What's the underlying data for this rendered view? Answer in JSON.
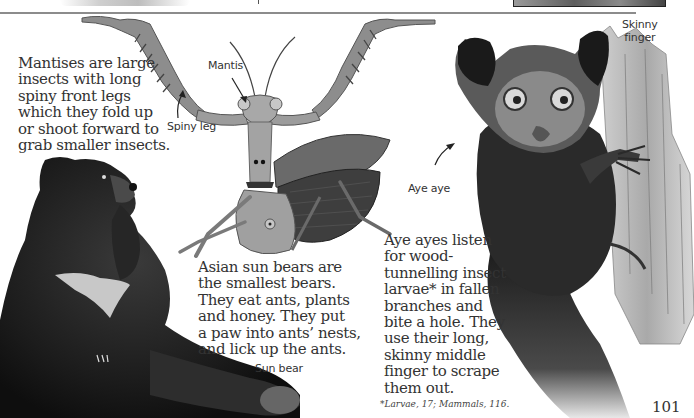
{
  "page": {
    "number": "101",
    "footnote": "*Larvae, 17; Mammals, 116."
  },
  "mantis": {
    "paragraph": [
      "Mantises are large",
      "insects with long",
      "spiny front legs",
      "which they fold up",
      "or shoot forward to",
      "grab smaller insects."
    ],
    "labels": {
      "name": "Mantis",
      "leg": "Spiny leg"
    }
  },
  "sun_bear": {
    "paragraph": [
      "Asian sun bears are",
      "the smallest bears.",
      "They eat ants, plants",
      "and honey. They put",
      "a paw into ants’ nests,",
      "and lick up the ants."
    ],
    "labels": {
      "name": "Sun bear"
    }
  },
  "aye_aye": {
    "paragraph": [
      "Aye ayes listen",
      "for wood-",
      "tunnelling insect",
      "larvae* in fallen",
      "branches and",
      "bite a hole. They",
      "use their long,",
      "skinny middle",
      "finger to scrape",
      "them out."
    ],
    "labels": {
      "name": "Aye aye",
      "finger_line1": "Skinny",
      "finger_line2": "finger"
    }
  },
  "colors": {
    "ink": "#333333",
    "divider": "#8c8c8c",
    "bear_fur": "#1c1c1c",
    "aye_fur": "#2a2a2a",
    "mantis_body": "#9a9a9a",
    "wood": "#b5b5b5"
  }
}
